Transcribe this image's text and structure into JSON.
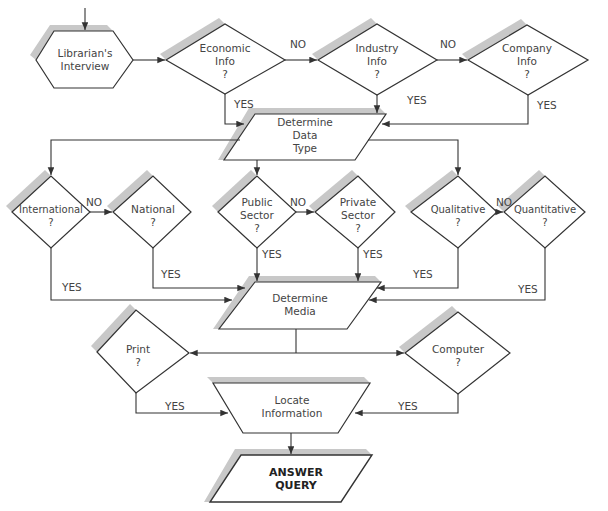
{
  "header": {
    "cropped_caption": "...query..."
  },
  "nodes": {
    "start": {
      "line1": "Librarian's",
      "line2": "Interview"
    },
    "economic": {
      "line1": "Economic",
      "line2": "Info",
      "line3": "?"
    },
    "industry": {
      "line1": "Industry",
      "line2": "Info",
      "line3": "?"
    },
    "company": {
      "line1": "Company",
      "line2": "Info",
      "line3": "?"
    },
    "data_type": {
      "line1": "Determine",
      "line2": "Data",
      "line3": "Type"
    },
    "international": {
      "line1": "International",
      "line2": "?"
    },
    "national": {
      "line1": "National",
      "line2": "?"
    },
    "public": {
      "line1": "Public",
      "line2": "Sector",
      "line3": "?"
    },
    "private": {
      "line1": "Private",
      "line2": "Sector",
      "line3": "?"
    },
    "qualitative": {
      "line1": "Qualitative",
      "line2": "?"
    },
    "quantitative": {
      "line1": "Quantitative",
      "line2": "?"
    },
    "media": {
      "line1": "Determine",
      "line2": "Media"
    },
    "print": {
      "line1": "Print",
      "line2": "?"
    },
    "computer": {
      "line1": "Computer",
      "line2": "?"
    },
    "locate": {
      "line1": "Locate",
      "line2": "Information"
    },
    "answer": {
      "line1": "ANSWER",
      "line2": "QUERY"
    }
  },
  "edges": {
    "no": "NO",
    "yes": "YES"
  },
  "colors": {
    "line": "#333333",
    "shadow": "#c8c8c8",
    "text": "#444444"
  }
}
